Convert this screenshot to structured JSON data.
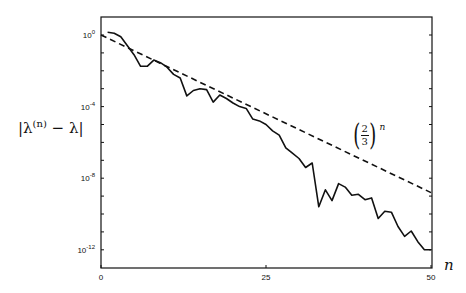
{
  "chart_data": {
    "type": "line",
    "title": "",
    "xlabel": "n",
    "ylabel": "|λ^(n) − λ|",
    "yscale": "log",
    "xlim": [
      0,
      50
    ],
    "ylim_log10": [
      -13,
      1
    ],
    "x_ticks": [
      0,
      25,
      50
    ],
    "x_tick_labels": [
      "0",
      "25",
      "50"
    ],
    "y_ticks_log10": [
      0,
      -4,
      -8,
      -12
    ],
    "y_tick_labels": [
      {
        "base": "10",
        "exp": "0"
      },
      {
        "base": "10",
        "exp": "-4"
      },
      {
        "base": "10",
        "exp": "-8"
      },
      {
        "base": "10",
        "exp": "-12"
      }
    ],
    "grid": false,
    "legend": "none",
    "annotation": {
      "text": "(2/3)^n",
      "numerator": "2",
      "denominator": "3",
      "exponent": "n"
    },
    "series": [
      {
        "name": "|λ^(n) − λ|",
        "style": "solid",
        "x": [
          1,
          2,
          3,
          4,
          5,
          6,
          7,
          8,
          9,
          10,
          11,
          12,
          13,
          14,
          15,
          16,
          17,
          18,
          19,
          20,
          21,
          22,
          23,
          24,
          25,
          26,
          27,
          28,
          29,
          30,
          31,
          32,
          33,
          34,
          35,
          36,
          37,
          38,
          39,
          40,
          41,
          42,
          43,
          44,
          45,
          46,
          47,
          48,
          49,
          50
        ],
        "log10_values": [
          0.15,
          0.1,
          -0.1,
          -0.6,
          -1.1,
          -1.75,
          -1.75,
          -1.4,
          -1.55,
          -1.8,
          -2.2,
          -2.4,
          -3.4,
          -3.1,
          -3.0,
          -3.05,
          -3.75,
          -3.35,
          -3.55,
          -3.8,
          -4.0,
          -4.1,
          -4.7,
          -4.8,
          -5.0,
          -5.35,
          -5.6,
          -6.3,
          -6.6,
          -6.9,
          -7.4,
          -7.15,
          -9.6,
          -8.65,
          -9.25,
          -8.3,
          -8.5,
          -8.95,
          -8.9,
          -9.2,
          -9.1,
          -10.25,
          -9.85,
          -9.9,
          -10.7,
          -11.25,
          -10.95,
          -11.55,
          -12.0,
          -12.0
        ]
      },
      {
        "name": "(2/3)^n",
        "style": "dashed",
        "x": [
          0,
          50
        ],
        "log10_values": [
          0,
          -8.805
        ]
      }
    ]
  }
}
